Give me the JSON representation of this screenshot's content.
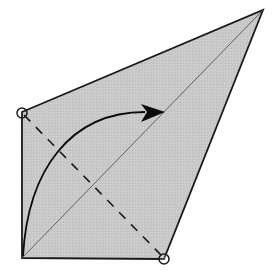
{
  "diagram": {
    "title": "Origami fold step: valley fold along dashed line",
    "colors": {
      "paper": "#c8c8c8",
      "outline": "#1a1a1a",
      "crease": "#555555",
      "dashed_fold": "#1a1a1a",
      "arrow": "#0a0a0a",
      "marker_fill": "#ffffff"
    },
    "elements": {
      "paper": "kite-shaped paper",
      "crease": "diagonal crease",
      "fold_line": "valley fold line (dashed)",
      "arrow": "fold direction arrow",
      "markers": [
        "corner marker top-left",
        "corner marker bottom-right"
      ]
    }
  }
}
